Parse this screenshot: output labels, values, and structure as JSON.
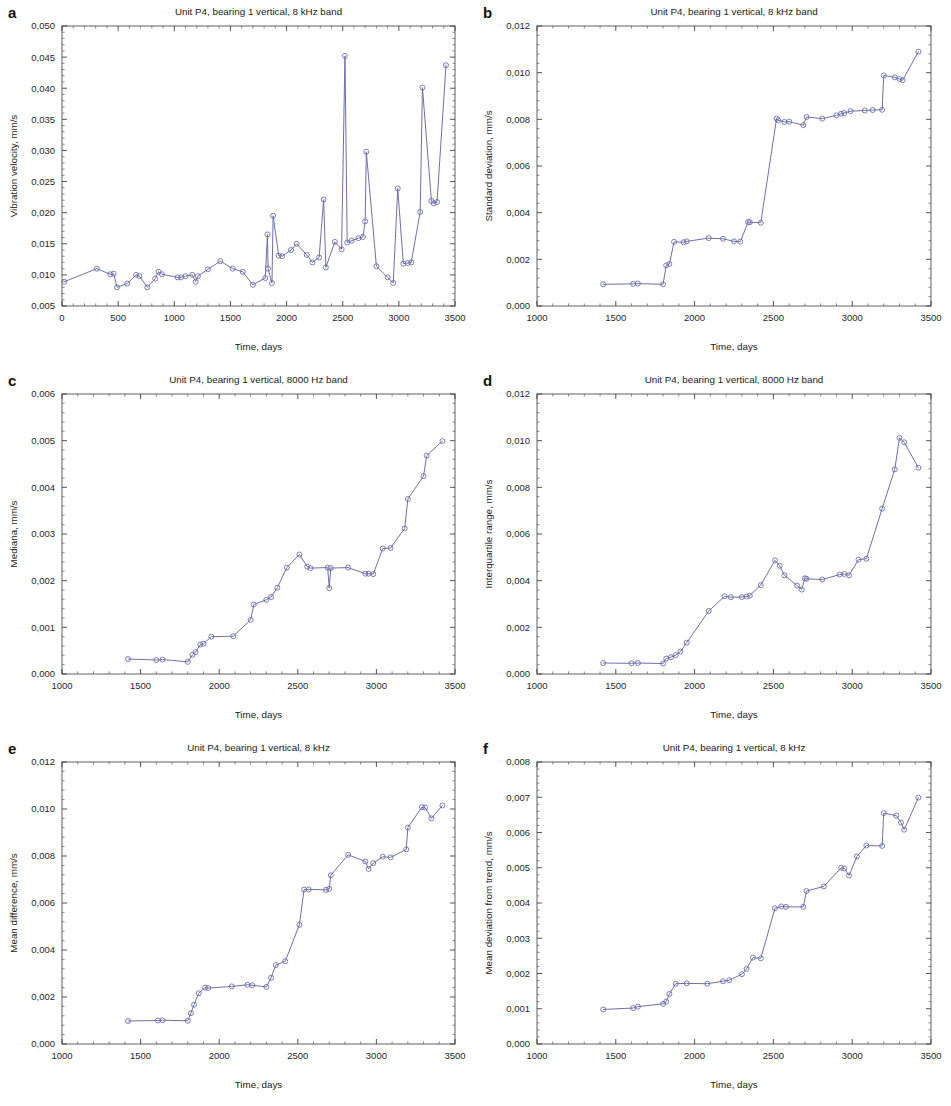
{
  "figure": {
    "xlabel": "Time, days",
    "series_color": "#6767a8",
    "axis_color": "#2b2b2b",
    "background": "#ffffff",
    "decimal_separator": ","
  },
  "panels": [
    {
      "letter": "a",
      "title": "Unit P4, bearing 1 vertical, 8 kHz band",
      "ylabel": "Vibration velocity, mm/s",
      "xlabel": "Time, days",
      "xlim": [
        0,
        3500
      ],
      "ylim": [
        0.005,
        0.05
      ],
      "xticks": [
        0,
        500,
        1000,
        1500,
        2000,
        2500,
        3000,
        3500
      ],
      "xticklabels": [
        "0",
        "500",
        "1000",
        "1500",
        "2000",
        "2500",
        "3000",
        "3500"
      ],
      "yticks": [
        0.005,
        0.01,
        0.015,
        0.02,
        0.025,
        0.03,
        0.035,
        0.04,
        0.045,
        0.05
      ],
      "yticklabels": [
        "0,005",
        "0,010",
        "0,015",
        "0,020",
        "0,025",
        "0,030",
        "0,035",
        "0,040",
        "0,045",
        "0,050"
      ]
    },
    {
      "letter": "b",
      "title": "Unit P4, bearing 1 vertical, 8 kHz band",
      "ylabel": "Standard deviation, mm/s",
      "xlabel": "Time, days",
      "xlim": [
        1000,
        3500
      ],
      "ylim": [
        0.0,
        0.012
      ],
      "xticks": [
        1000,
        1500,
        2000,
        2500,
        3000,
        3500
      ],
      "xticklabels": [
        "1000",
        "1500",
        "2000",
        "2500",
        "3000",
        "3500"
      ],
      "yticks": [
        0.0,
        0.002,
        0.004,
        0.006,
        0.008,
        0.01,
        0.012
      ],
      "yticklabels": [
        "0,000",
        "0,002",
        "0,004",
        "0,006",
        "0,008",
        "0,010",
        "0,012"
      ]
    },
    {
      "letter": "c",
      "title": "Unit P4, bearing 1 vertical, 8000 Hz band",
      "ylabel": "Mediana, mm/s",
      "xlabel": "Time, days",
      "xlim": [
        1000,
        3500
      ],
      "ylim": [
        0.0,
        0.006
      ],
      "xticks": [
        1000,
        1500,
        2000,
        2500,
        3000,
        3500
      ],
      "xticklabels": [
        "1000",
        "1500",
        "2000",
        "2500",
        "3000",
        "3500"
      ],
      "yticks": [
        0.0,
        0.001,
        0.002,
        0.003,
        0.004,
        0.005,
        0.006
      ],
      "yticklabels": [
        "0,000",
        "0,001",
        "0,002",
        "0,003",
        "0,004",
        "0,005",
        "0,006"
      ]
    },
    {
      "letter": "d",
      "title": "Unit P4, bearing 1 vertical, 8000 Hz band",
      "ylabel": "Interquartile range, mm/s",
      "xlabel": "Time, days",
      "xlim": [
        1000,
        3500
      ],
      "ylim": [
        0.0,
        0.012
      ],
      "xticks": [
        1000,
        1500,
        2000,
        2500,
        3000,
        3500
      ],
      "xticklabels": [
        "1000",
        "1500",
        "2000",
        "2500",
        "3000",
        "3500"
      ],
      "yticks": [
        0.0,
        0.002,
        0.004,
        0.006,
        0.008,
        0.01,
        0.012
      ],
      "yticklabels": [
        "0,000",
        "0,002",
        "0,004",
        "0,006",
        "0,008",
        "0,010",
        "0,012"
      ]
    },
    {
      "letter": "e",
      "title": "Unit P4, bearing 1 vertical, 8 kHz",
      "ylabel": "Mean difference, mm/s",
      "xlabel": "Time, days",
      "xlim": [
        1000,
        3500
      ],
      "ylim": [
        0.0,
        0.012
      ],
      "xticks": [
        1000,
        1500,
        2000,
        2500,
        3000,
        3500
      ],
      "xticklabels": [
        "1000",
        "1500",
        "2000",
        "2500",
        "3000",
        "3500"
      ],
      "yticks": [
        0.0,
        0.002,
        0.004,
        0.006,
        0.008,
        0.01,
        0.012
      ],
      "yticklabels": [
        "0,000",
        "0,002",
        "0,004",
        "0,006",
        "0,008",
        "0,010",
        "0,012"
      ]
    },
    {
      "letter": "f",
      "title": "Unit P4, bearing 1 vertical, 8 kHz",
      "ylabel": "Mean deviation from trend, mm/s",
      "xlabel": "Time, days",
      "xlim": [
        1000,
        3500
      ],
      "ylim": [
        0.0,
        0.008
      ],
      "xticks": [
        1000,
        1500,
        2000,
        2500,
        3000,
        3500
      ],
      "xticklabels": [
        "1000",
        "1500",
        "2000",
        "2500",
        "3000",
        "3500"
      ],
      "yticks": [
        0.0,
        0.001,
        0.002,
        0.003,
        0.004,
        0.005,
        0.006,
        0.007,
        0.008
      ],
      "yticklabels": [
        "0,000",
        "0,001",
        "0,002",
        "0,003",
        "0,004",
        "0,005",
        "0,006",
        "0,007",
        "0,008"
      ]
    }
  ],
  "chart_data": [
    {
      "panel": "a",
      "type": "line",
      "title": "Unit P4, bearing 1 vertical, 8 kHz band",
      "xlabel": "Time, days",
      "ylabel": "Vibration velocity, mm/s",
      "xlim": [
        0,
        3500
      ],
      "ylim": [
        0.005,
        0.05
      ],
      "grid": false,
      "marker": "circle-open",
      "x": [
        20,
        310,
        430,
        460,
        490,
        580,
        660,
        690,
        760,
        830,
        860,
        890,
        1030,
        1060,
        1100,
        1160,
        1190,
        1210,
        1300,
        1410,
        1520,
        1610,
        1700,
        1810,
        1830,
        1835,
        1870,
        1880,
        1930,
        1960,
        2040,
        2090,
        2180,
        2230,
        2290,
        2330,
        2350,
        2430,
        2490,
        2520,
        2540,
        2580,
        2640,
        2680,
        2700,
        2710,
        2800,
        2900,
        2950,
        2990,
        3040,
        3080,
        3110,
        3190,
        3210,
        3290,
        3310,
        3340,
        3420
      ],
      "y": [
        0.0089,
        0.011,
        0.0101,
        0.0102,
        0.008,
        0.0086,
        0.01,
        0.0098,
        0.008,
        0.0094,
        0.0105,
        0.0101,
        0.0096,
        0.0096,
        0.0098,
        0.01,
        0.0089,
        0.0098,
        0.0109,
        0.0122,
        0.011,
        0.0105,
        0.0084,
        0.0095,
        0.0165,
        0.011,
        0.0087,
        0.0195,
        0.0131,
        0.013,
        0.014,
        0.015,
        0.0132,
        0.012,
        0.0128,
        0.0221,
        0.0112,
        0.0153,
        0.0141,
        0.0452,
        0.0152,
        0.0155,
        0.0159,
        0.0161,
        0.0186,
        0.0298,
        0.0114,
        0.0096,
        0.0087,
        0.0239,
        0.0118,
        0.0119,
        0.012,
        0.0201,
        0.0401,
        0.0219,
        0.0215,
        0.0217,
        0.0437
      ]
    },
    {
      "panel": "b",
      "type": "line",
      "title": "Unit P4, bearing 1 vertical, 8 kHz band",
      "xlabel": "Time, days",
      "ylabel": "Standard deviation, mm/s",
      "xlim": [
        1000,
        3500
      ],
      "ylim": [
        0.0,
        0.012
      ],
      "grid": false,
      "marker": "circle-open",
      "x": [
        1420,
        1610,
        1640,
        1800,
        1820,
        1840,
        1870,
        1930,
        1950,
        2090,
        2180,
        2250,
        2290,
        2340,
        2350,
        2420,
        2520,
        2530,
        2570,
        2600,
        2690,
        2710,
        2810,
        2900,
        2930,
        2950,
        2990,
        3080,
        3130,
        3190,
        3200,
        3270,
        3300,
        3320,
        3420
      ],
      "y": [
        0.00093,
        0.00095,
        0.00096,
        0.00093,
        0.00174,
        0.0018,
        0.00275,
        0.00273,
        0.00277,
        0.00291,
        0.00288,
        0.00277,
        0.00276,
        0.0036,
        0.00359,
        0.00357,
        0.00803,
        0.00796,
        0.00789,
        0.0079,
        0.00775,
        0.0081,
        0.00803,
        0.00817,
        0.00824,
        0.00827,
        0.00835,
        0.00838,
        0.0084,
        0.00841,
        0.00988,
        0.0098,
        0.00973,
        0.00968,
        0.0109
      ]
    },
    {
      "panel": "c",
      "type": "line",
      "title": "Unit P4, bearing 1 vertical, 8000 Hz band",
      "xlabel": "Time, days",
      "ylabel": "Mediana, mm/s",
      "xlim": [
        1000,
        3500
      ],
      "ylim": [
        0.0,
        0.006
      ],
      "grid": false,
      "marker": "circle-open",
      "x": [
        1420,
        1600,
        1640,
        1800,
        1830,
        1850,
        1880,
        1900,
        1950,
        2090,
        2200,
        2220,
        2300,
        2330,
        2370,
        2430,
        2510,
        2560,
        2580,
        2690,
        2700,
        2710,
        2820,
        2930,
        2950,
        2980,
        3040,
        3090,
        3180,
        3200,
        3300,
        3320,
        3420
      ],
      "y": [
        0.00032,
        0.0003,
        0.00031,
        0.00026,
        0.00041,
        0.00047,
        0.00063,
        0.00065,
        0.0008,
        0.00081,
        0.00116,
        0.00149,
        0.00159,
        0.00165,
        0.00185,
        0.00228,
        0.00256,
        0.0023,
        0.00227,
        0.00228,
        0.00184,
        0.00227,
        0.00228,
        0.00215,
        0.00215,
        0.00214,
        0.00269,
        0.0027,
        0.00312,
        0.00375,
        0.00424,
        0.00468,
        0.00499
      ]
    },
    {
      "panel": "d",
      "type": "line",
      "title": "Unit P4, bearing 1 vertical, 8000 Hz band",
      "xlabel": "Time, days",
      "ylabel": "Interquartile range, mm/s",
      "xlim": [
        1000,
        3500
      ],
      "ylim": [
        0.0,
        0.012
      ],
      "grid": false,
      "marker": "circle-open",
      "x": [
        1420,
        1600,
        1640,
        1800,
        1820,
        1850,
        1880,
        1910,
        1950,
        2090,
        2190,
        2230,
        2300,
        2330,
        2350,
        2420,
        2510,
        2540,
        2570,
        2650,
        2680,
        2700,
        2710,
        2810,
        2920,
        2950,
        2980,
        3040,
        3090,
        3190,
        3270,
        3300,
        3330,
        3420
      ],
      "y": [
        0.00047,
        0.00046,
        0.00047,
        0.00045,
        0.00066,
        0.00072,
        0.00081,
        0.00096,
        0.00134,
        0.0027,
        0.00333,
        0.00329,
        0.0033,
        0.00332,
        0.00336,
        0.00381,
        0.00487,
        0.00464,
        0.00423,
        0.00379,
        0.00362,
        0.0041,
        0.00408,
        0.00405,
        0.00426,
        0.00429,
        0.00423,
        0.0049,
        0.00494,
        0.00709,
        0.00877,
        0.01012,
        0.00993,
        0.00884
      ]
    },
    {
      "panel": "e",
      "type": "line",
      "title": "Unit P4, bearing 1 vertical, 8 kHz",
      "xlabel": "Time, days",
      "ylabel": "Mean difference, mm/s",
      "xlim": [
        1000,
        3500
      ],
      "ylim": [
        0.0,
        0.012
      ],
      "grid": false,
      "marker": "circle-open",
      "x": [
        1420,
        1610,
        1640,
        1800,
        1820,
        1840,
        1870,
        1910,
        1930,
        2080,
        2180,
        2210,
        2300,
        2330,
        2360,
        2420,
        2510,
        2540,
        2570,
        2680,
        2700,
        2710,
        2820,
        2930,
        2950,
        2980,
        3040,
        3090,
        3190,
        3200,
        3290,
        3310,
        3350,
        3420
      ],
      "y": [
        0.00098,
        0.001,
        0.00101,
        0.00099,
        0.00131,
        0.00167,
        0.00216,
        0.0024,
        0.00238,
        0.00245,
        0.00252,
        0.0025,
        0.00243,
        0.00282,
        0.00336,
        0.00352,
        0.00507,
        0.00657,
        0.00658,
        0.00656,
        0.0066,
        0.00718,
        0.00805,
        0.00777,
        0.00745,
        0.0077,
        0.00797,
        0.00794,
        0.00828,
        0.00921,
        0.01008,
        0.01006,
        0.0096,
        0.01015
      ]
    },
    {
      "panel": "f",
      "type": "line",
      "title": "Unit P4, bearing 1 vertical, 8 kHz",
      "xlabel": "Time, days",
      "ylabel": "Mean deviation from trend, mm/s",
      "xlim": [
        1000,
        3500
      ],
      "ylim": [
        0.0,
        0.008
      ],
      "grid": false,
      "marker": "circle-open",
      "x": [
        1420,
        1610,
        1640,
        1800,
        1820,
        1840,
        1880,
        1950,
        2080,
        2180,
        2220,
        2300,
        2330,
        2370,
        2420,
        2510,
        2550,
        2580,
        2690,
        2710,
        2820,
        2930,
        2950,
        2980,
        3030,
        3090,
        3190,
        3200,
        3280,
        3310,
        3330,
        3420
      ],
      "y": [
        0.00098,
        0.00102,
        0.00106,
        0.00114,
        0.0012,
        0.00142,
        0.00171,
        0.00172,
        0.00171,
        0.00178,
        0.00181,
        0.00198,
        0.00213,
        0.00245,
        0.00243,
        0.00385,
        0.0039,
        0.00389,
        0.00389,
        0.00434,
        0.00447,
        0.005,
        0.00498,
        0.00478,
        0.00532,
        0.00563,
        0.00562,
        0.00655,
        0.00648,
        0.00628,
        0.00608,
        0.00699
      ]
    }
  ]
}
